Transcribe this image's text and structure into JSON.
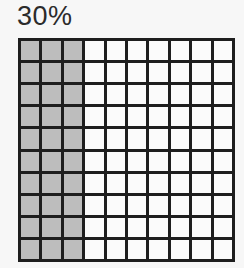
{
  "title": "30%",
  "grid": {
    "rows": 10,
    "cols": 10,
    "shaded_columns": 3,
    "shaded_color": "#bdbdbd",
    "empty_color": "#fbfbfb",
    "line_color": "#1e1e1e"
  }
}
